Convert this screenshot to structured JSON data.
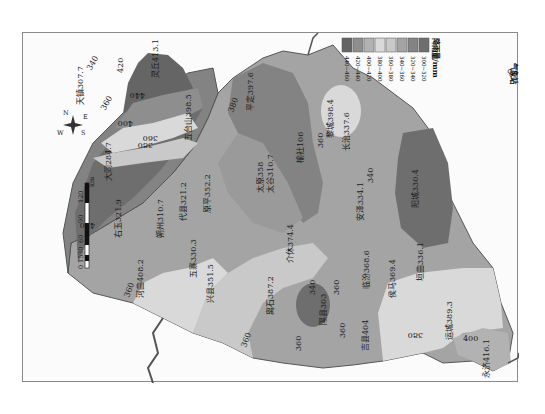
{
  "map": {
    "title": "",
    "orientation": "rotated 90° counter-clockwise",
    "region": "Shanxi",
    "unit_label": "降雨量/mm",
    "legend": {
      "title": "降雨量/mm",
      "classes": [
        {
          "range": "300~320",
          "color": "#6e6e6e"
        },
        {
          "range": "320~340",
          "color": "#838383"
        },
        {
          "range": "340~360",
          "color": "#a4a4a4"
        },
        {
          "range": "360~380",
          "color": "#c9c9c9"
        },
        {
          "range": "380~400",
          "color": "#d9d9d9"
        },
        {
          "range": "400~420",
          "color": "#b2b2b2"
        },
        {
          "range": "420~440",
          "color": "#8e8e8e"
        },
        {
          "range": "440~460",
          "color": "#656565"
        }
      ],
      "station_symbol_label": "气象站"
    },
    "scale_bar": {
      "ticks": [
        "0",
        "15",
        "30",
        "60",
        "90",
        "120"
      ],
      "unit": "km"
    },
    "compass": {
      "N": "N",
      "E": "E",
      "S": "S",
      "W": "W"
    },
    "stations": [
      {
        "name": "天镇",
        "value": "307.7"
      },
      {
        "name": "灵丘",
        "value": "413.1"
      },
      {
        "name": "五台山",
        "value": "398.5"
      },
      {
        "name": "大同",
        "value": "284.7"
      },
      {
        "name": "右玉",
        "value": "321.9"
      },
      {
        "name": "朔州",
        "value": "310.7"
      },
      {
        "name": "代县",
        "value": "321.2"
      },
      {
        "name": "原平",
        "value": "352.2"
      },
      {
        "name": "五寨",
        "value": "330.3"
      },
      {
        "name": "河曲",
        "value": "408.2"
      },
      {
        "name": "兴县",
        "value": "351.5"
      },
      {
        "name": "平定",
        "value": "397.6"
      },
      {
        "name": "太原",
        "value": "358"
      },
      {
        "name": "太谷",
        "value": "310.7"
      },
      {
        "name": "榆社",
        "value": "106"
      },
      {
        "name": "黎城",
        "value": "398.4"
      },
      {
        "name": "长治",
        "value": "337.6"
      },
      {
        "name": "介休",
        "value": "374.4"
      },
      {
        "name": "安泽",
        "value": "334.1"
      },
      {
        "name": "阳城",
        "value": "330.4"
      },
      {
        "name": "离石",
        "value": "387.2"
      },
      {
        "name": "隰县",
        "value": "303"
      },
      {
        "name": "临汾",
        "value": "368.6"
      },
      {
        "name": "侯马",
        "value": "369.4"
      },
      {
        "name": "垣曲",
        "value": "336.1"
      },
      {
        "name": "吉县",
        "value": "404"
      },
      {
        "name": "运城",
        "value": "389.3"
      },
      {
        "name": "永济",
        "value": "416.1"
      }
    ],
    "isolines": [
      "340",
      "360",
      "380",
      "400",
      "420",
      "440",
      "360",
      "380",
      "360",
      "340",
      "360",
      "360",
      "340",
      "360",
      "380",
      "400",
      "420"
    ]
  }
}
